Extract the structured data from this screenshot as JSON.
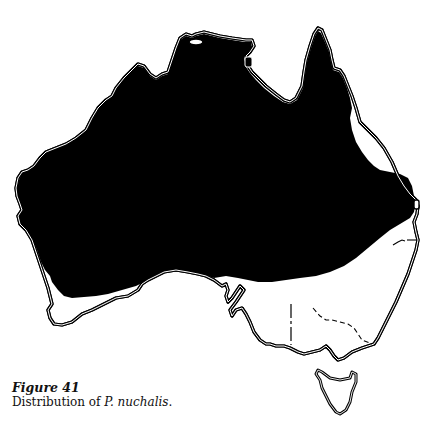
{
  "figure": {
    "label": "Figure 41",
    "caption_prefix": "Distribution of ",
    "species": "P. nuchalis",
    "caption_suffix": "."
  },
  "map": {
    "region": "Australia",
    "features": [
      {
        "name": "mainland-outline",
        "style": "double coastline"
      },
      {
        "name": "distribution-range",
        "fill": "#000000"
      },
      {
        "name": "tasmania-outline",
        "style": "double coastline"
      },
      {
        "name": "state-borders",
        "style": "dashed/solid thin lines in south-east"
      }
    ],
    "colors": {
      "range_fill": "#000000",
      "outline": "#000000",
      "background": "#ffffff"
    }
  }
}
